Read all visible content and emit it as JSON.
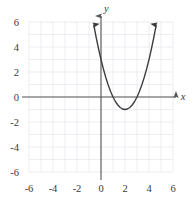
{
  "figure": {
    "name": "parabola-graph",
    "background_color": "#ffffff",
    "grid_color": "#e8e8ef",
    "axis_color": "#555555",
    "curve_color": "#3c3c3c"
  },
  "axes": {
    "x_axis_label": "x",
    "y_axis_label": "y",
    "x_ticks": [
      "-6",
      "-4",
      "-2",
      "0",
      "2",
      "4",
      "6"
    ],
    "y_ticks": [
      "6",
      "4",
      "2",
      "0",
      "-2",
      "-4",
      "-6"
    ],
    "x_tick_values": [
      -6,
      -4,
      -2,
      0,
      2,
      4,
      6
    ],
    "y_tick_values": [
      6,
      4,
      2,
      0,
      -2,
      -4,
      -6
    ]
  },
  "chart_data": {
    "type": "line",
    "title": "",
    "subtitle": "",
    "xlabel": "x",
    "ylabel": "y",
    "xlim": [
      -6.5,
      6.5
    ],
    "ylim": [
      -6.5,
      6.5
    ],
    "xticks": [
      -6,
      -4,
      -2,
      0,
      2,
      4,
      6
    ],
    "yticks": [
      -6,
      -4,
      -2,
      0,
      2,
      4,
      6
    ],
    "grid": true,
    "grid_step": 1,
    "legend": null,
    "legend_position": "none",
    "annotations": [],
    "series": [
      {
        "name": "parabola",
        "equation": "y = (x - 2)^2 - 1",
        "expanded": "y = x^2 - 4x + 3",
        "vertex": [
          2,
          -1
        ],
        "roots": [
          1,
          3
        ],
        "y_intercept": 3,
        "opens": "up",
        "arrow_start": true,
        "arrow_end": true,
        "x": [
          -0.6,
          -0.4,
          -0.2,
          0.0,
          0.2,
          0.4,
          0.6,
          0.8,
          1.0,
          1.2,
          1.4,
          1.6,
          1.8,
          2.0,
          2.2,
          2.4,
          2.6,
          2.8,
          3.0,
          3.2,
          3.4,
          3.6,
          3.8,
          4.0,
          4.2,
          4.4,
          4.6
        ],
        "y": [
          5.76,
          4.76,
          3.84,
          3.0,
          2.24,
          1.56,
          0.96,
          0.44,
          0.0,
          -0.36,
          -0.64,
          -0.84,
          -0.96,
          -1.0,
          -0.96,
          -0.84,
          -0.64,
          -0.36,
          0.0,
          0.44,
          0.96,
          1.56,
          2.24,
          3.0,
          3.84,
          4.76,
          5.76
        ]
      }
    ]
  }
}
